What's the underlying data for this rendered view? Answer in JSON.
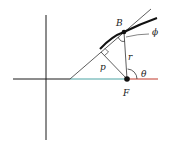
{
  "diagram": {
    "title": "",
    "labels": {
      "point_B": "B",
      "point_F": "F",
      "distance_p": "p",
      "radius_r": "r",
      "angle_theta": "θ",
      "angle_phi": "ϕ"
    },
    "colors": {
      "axis": "#1a1a1a",
      "segment_left_of_F": "#4aa3a3",
      "ray_right_of_F": "#c0392b",
      "curve": "#111111",
      "line": "#333333"
    }
  }
}
